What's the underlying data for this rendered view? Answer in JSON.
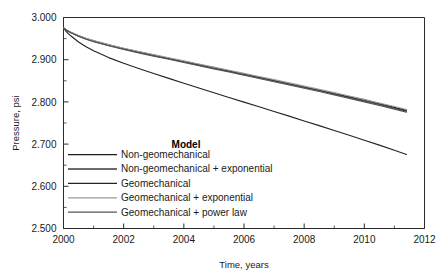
{
  "chart_data": {
    "type": "line",
    "title": "",
    "xlabel": "Time, years",
    "ylabel": "Pressure, psi",
    "xlim": [
      2000,
      2012
    ],
    "ylim": [
      2.5,
      3.0
    ],
    "grid": false,
    "legend_position": "inside-lower-left",
    "legend_title": "Model",
    "x_ticks": [
      "2000",
      "2002",
      "2004",
      "2006",
      "2008",
      "2010",
      "2012"
    ],
    "x_tick_values": [
      2000,
      2002,
      2004,
      2006,
      2008,
      2010,
      2012
    ],
    "x_minor_tick_values": [
      2001,
      2003,
      2005,
      2007,
      2009,
      2011
    ],
    "y_ticks": [
      "2.500",
      "2.600",
      "2.700",
      "2.800",
      "2.900",
      "3.000"
    ],
    "y_tick_values": [
      2.5,
      2.6,
      2.7,
      2.8,
      2.9,
      3.0
    ],
    "y_minor_tick_values": [
      2.55,
      2.65,
      2.75,
      2.85,
      2.95
    ],
    "x": [
      2000.0,
      2000.1,
      2000.25,
      2000.5,
      2000.75,
      2001.0,
      2001.5,
      2002.0,
      2002.5,
      2003.0,
      2003.5,
      2004.0,
      2004.5,
      2005.0,
      2005.5,
      2006.0,
      2006.5,
      2007.0,
      2007.5,
      2008.0,
      2008.5,
      2009.0,
      2009.5,
      2010.0,
      2010.5,
      2011.0,
      2011.4
    ],
    "series": [
      {
        "name": "Non-geomechanical",
        "color": "#1c1c1c",
        "values": [
          2.9755,
          2.97,
          2.9645,
          2.9565,
          2.95,
          2.9445,
          2.935,
          2.9265,
          2.9185,
          2.911,
          2.9035,
          2.896,
          2.8885,
          2.881,
          2.8735,
          2.866,
          2.8585,
          2.851,
          2.8435,
          2.8355,
          2.828,
          2.82,
          2.812,
          2.804,
          2.7955,
          2.787,
          2.78
        ]
      },
      {
        "name": "Non-geomechanical + exponential",
        "color": "#3a3a3a",
        "values": [
          2.9755,
          2.9698,
          2.9641,
          2.9559,
          2.9492,
          2.9436,
          2.9339,
          2.9253,
          2.9172,
          2.9096,
          2.9021,
          2.8946,
          2.8871,
          2.8796,
          2.8721,
          2.8646,
          2.8571,
          2.8496,
          2.842,
          2.834,
          2.8264,
          2.8184,
          2.8103,
          2.8022,
          2.7937,
          2.7851,
          2.778
        ]
      },
      {
        "name": "Geomechanical",
        "color": "#232323",
        "values": [
          2.9755,
          2.966,
          2.956,
          2.942,
          2.9305,
          2.921,
          2.905,
          2.8915,
          2.879,
          2.8672,
          2.8557,
          2.8443,
          2.833,
          2.8218,
          2.8106,
          2.7995,
          2.7884,
          2.7773,
          2.7662,
          2.7548,
          2.7437,
          2.7323,
          2.7208,
          2.7093,
          2.6975,
          2.6855,
          2.6755
        ]
      },
      {
        "name": "Geomechanical + exponential",
        "color": "#9a9a9a",
        "values": [
          2.9755,
          2.9702,
          2.9648,
          2.957,
          2.9505,
          2.9451,
          2.9356,
          2.9272,
          2.9193,
          2.9119,
          2.9045,
          2.8971,
          2.8897,
          2.8823,
          2.8749,
          2.8675,
          2.8601,
          2.8527,
          2.8452,
          2.8373,
          2.8298,
          2.8219,
          2.8139,
          2.8059,
          2.7975,
          2.789,
          2.782
        ]
      },
      {
        "name": "Geomechanical + power law",
        "color": "#555555",
        "values": [
          2.9755,
          2.9696,
          2.9638,
          2.9554,
          2.9486,
          2.9429,
          2.9331,
          2.9244,
          2.9163,
          2.9086,
          2.901,
          2.8934,
          2.8858,
          2.8783,
          2.8707,
          2.8631,
          2.8555,
          2.8479,
          2.8403,
          2.8322,
          2.8245,
          2.8165,
          2.8084,
          2.8002,
          2.7917,
          2.783,
          2.7758
        ]
      }
    ]
  },
  "axis": {
    "y_title": "Pressure, psi",
    "x_title": "Time, years"
  },
  "legend": {
    "title": "Model",
    "entries": [
      {
        "label": "Non-geomechanical",
        "color": "#1c1c1c"
      },
      {
        "label": "Non-geomechanical + exponential",
        "color": "#3a3a3a"
      },
      {
        "label": "Geomechanical",
        "color": "#232323"
      },
      {
        "label": "Geomechanical + exponential",
        "color": "#9a9a9a"
      },
      {
        "label": "Geomechanical + power law",
        "color": "#555555"
      }
    ]
  },
  "colors": {
    "axis": "#2b2b2b",
    "text": "#1a1a1a",
    "background": "#ffffff"
  }
}
